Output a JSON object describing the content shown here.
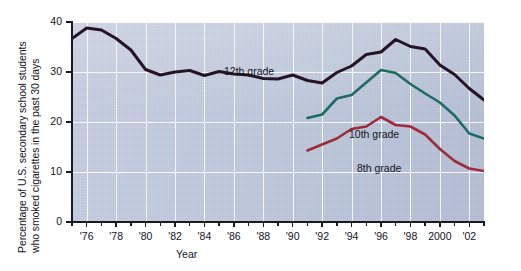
{
  "chart_data": {
    "type": "line",
    "title": "",
    "xlabel": "Year",
    "ylabel": "Percentage of U.S. secondary school students who smoked cigarettes in the past 30 days",
    "ylabel_line1": "Percentage of U.S. secondary school students",
    "ylabel_line2": "who smoked cigarettes in the past 30 days",
    "xlim": [
      1975,
      2003
    ],
    "ylim": [
      0,
      40
    ],
    "yticks": [
      0,
      10,
      20,
      30,
      40
    ],
    "ytick_labels": [
      "0",
      "10",
      "20",
      "30",
      "40"
    ],
    "xticks": [
      1976,
      1978,
      1980,
      1982,
      1984,
      1986,
      1988,
      1990,
      1992,
      1994,
      1996,
      1998,
      2000,
      2002
    ],
    "xtick_labels": [
      "'76",
      "'78",
      "'80",
      "'82",
      "'84",
      "'86",
      "'88",
      "'90",
      "'92",
      "'94",
      "'96",
      "'98",
      "2000",
      "'02"
    ],
    "grid": true,
    "legend": "inline-annotations",
    "series": [
      {
        "name": "12th grade",
        "color": "#241426",
        "x": [
          1975,
          1976,
          1977,
          1978,
          1979,
          1980,
          1981,
          1982,
          1983,
          1984,
          1985,
          1986,
          1987,
          1988,
          1989,
          1990,
          1991,
          1992,
          1993,
          1994,
          1995,
          1996,
          1997,
          1998,
          1999,
          2000,
          2001,
          2002,
          2003
        ],
        "values": [
          36.7,
          38.8,
          38.4,
          36.7,
          34.4,
          30.5,
          29.4,
          30.0,
          30.3,
          29.3,
          30.1,
          29.6,
          29.4,
          28.7,
          28.6,
          29.4,
          28.3,
          27.8,
          29.9,
          31.2,
          33.5,
          34.0,
          36.5,
          35.1,
          34.6,
          31.4,
          29.5,
          26.7,
          24.4
        ]
      },
      {
        "name": "10th grade",
        "color": "#1d6b63",
        "x": [
          1991,
          1992,
          1993,
          1994,
          1995,
          1996,
          1997,
          1998,
          1999,
          2000,
          2001,
          2002,
          2003
        ],
        "values": [
          20.8,
          21.5,
          24.7,
          25.4,
          27.9,
          30.4,
          29.8,
          27.6,
          25.7,
          23.9,
          21.3,
          17.7,
          16.7
        ]
      },
      {
        "name": "8th grade",
        "color": "#9e2b3a",
        "x": [
          1991,
          1992,
          1993,
          1994,
          1995,
          1996,
          1997,
          1998,
          1999,
          2000,
          2001,
          2002,
          2003
        ],
        "values": [
          14.3,
          15.5,
          16.7,
          18.6,
          19.1,
          21.0,
          19.4,
          19.1,
          17.5,
          14.6,
          12.2,
          10.7,
          10.2
        ]
      }
    ],
    "colors": {
      "plot_background": "#bdc6da",
      "gridline": "#ffffff",
      "axis": "#1a1a22",
      "series_12th": "#241426",
      "series_10th": "#1d6b63",
      "series_8th": "#9e2b3a"
    }
  }
}
